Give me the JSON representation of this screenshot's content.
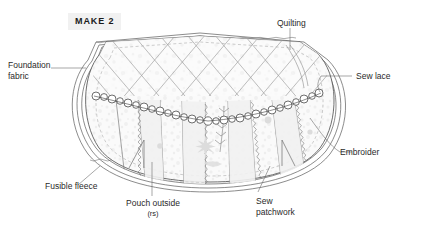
{
  "page": {
    "width": 421,
    "height": 237,
    "background": "#ffffff",
    "ink": "#3c3c3c",
    "text_color": "#2a2a2a"
  },
  "badge": {
    "label": "MAKE 2",
    "background": "#f1f1f1",
    "color": "#1b1b1b"
  },
  "callouts": [
    {
      "name": "foundation-fabric",
      "line1": "Foundation",
      "line2": "fabric"
    },
    {
      "name": "quilting",
      "line1": "Quilting",
      "line2": ""
    },
    {
      "name": "sew-lace",
      "line1": "Sew lace",
      "line2": ""
    },
    {
      "name": "embroider",
      "line1": "Embroider",
      "line2": ""
    },
    {
      "name": "fusible-fleece",
      "line1": "Fusible fleece",
      "line2": ""
    },
    {
      "name": "pouch-outside",
      "line1": "Pouch outside",
      "line2": "(rs)"
    },
    {
      "name": "sew-patchwork",
      "line1": "Sew",
      "line2": "patchwork"
    }
  ],
  "diagram": {
    "fabric_fill": "#f7f7f7",
    "line_color": "#4a4a4a",
    "light_line_color": "#b9b9b9",
    "motif_color": "#d8d8d8"
  }
}
